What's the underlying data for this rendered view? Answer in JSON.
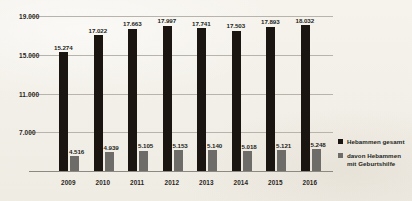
{
  "chart_data": {
    "type": "bar",
    "title": "",
    "xlabel": "",
    "ylabel": "",
    "categories": [
      "2009",
      "2010",
      "2011",
      "2012",
      "2013",
      "2014",
      "2015",
      "2016"
    ],
    "ylim": [
      3000,
      19000
    ],
    "yticks": [
      7000,
      11000,
      15000,
      19000
    ],
    "ytick_labels": [
      "7.000",
      "11.000",
      "15.000",
      "19.000"
    ],
    "grid": true,
    "legend_position": "right",
    "series": [
      {
        "name": "Hebammen gesamt",
        "color": "#1b1512",
        "values": [
          15274,
          17022,
          17663,
          17997,
          17741,
          17503,
          17893,
          18032
        ],
        "labels": [
          "15.274",
          "17.022",
          "17.663",
          "17.997",
          "17.741",
          "17.503",
          "17.893",
          "18.032"
        ]
      },
      {
        "name": "davon Hebammen mit Geburtshilfe",
        "color": "#6e6c69",
        "values": [
          4516,
          4939,
          5105,
          5153,
          5140,
          5018,
          5121,
          5248
        ],
        "labels": [
          "4.516",
          "4.939",
          "5.105",
          "5.153",
          "5.140",
          "5.018",
          "5.121",
          "5.248"
        ]
      }
    ]
  },
  "legend": {
    "items": [
      {
        "label": "Hebammen gesamt",
        "swatch": "#1b1512"
      },
      {
        "label": "davon Hebammen mit Geburtshilfe",
        "line1": "davon Hebammen",
        "line2": "mit Geburtshilfe",
        "swatch": "#6e6c69"
      }
    ]
  },
  "colors": {
    "background": "#f4f1eb",
    "total_bar": "#1b1512",
    "obstetrics_bar": "#6e6c69",
    "gridline": "#b9b4ab",
    "text": "#241f1b"
  }
}
